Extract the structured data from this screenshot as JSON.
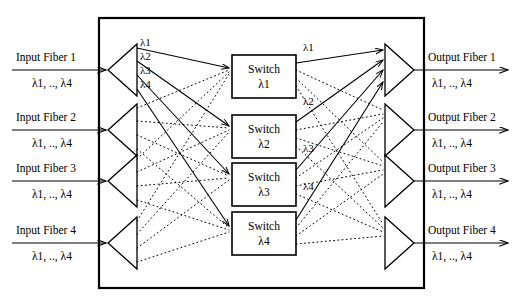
{
  "diagram": {
    "colors": {
      "line": "#000000",
      "background": "#ffffff",
      "box_fill": "#ffffff"
    },
    "inputs": [
      {
        "label": "Input Fiber 1",
        "wavelengths": "λ1, .., λ4"
      },
      {
        "label": "Input Fiber 2",
        "wavelengths": "λ1, .., λ4"
      },
      {
        "label": "Input Fiber 3",
        "wavelengths": "λ1, .., λ4"
      },
      {
        "label": "Input Fiber 4",
        "wavelengths": "λ1, .., λ4"
      }
    ],
    "outputs": [
      {
        "label": "Output Fiber 1",
        "wavelengths": "λ1, .., λ4"
      },
      {
        "label": "Output Fiber 2",
        "wavelengths": "λ1, .., λ4"
      },
      {
        "label": "Output Fiber 3",
        "wavelengths": "λ1, .., λ4"
      },
      {
        "label": "Output Fiber 4",
        "wavelengths": "λ1, .., λ4"
      }
    ],
    "switches": [
      {
        "line1": "Switch",
        "line2": "λ1"
      },
      {
        "line1": "Switch",
        "line2": "λ2"
      },
      {
        "line1": "Switch",
        "line2": "λ3"
      },
      {
        "line1": "Switch",
        "line2": "λ4"
      }
    ],
    "demux_labels": [
      "λ1",
      "λ2",
      "λ3",
      "λ4"
    ],
    "mux_labels": [
      "λ1",
      "λ2",
      "λ3",
      "λ4"
    ]
  }
}
